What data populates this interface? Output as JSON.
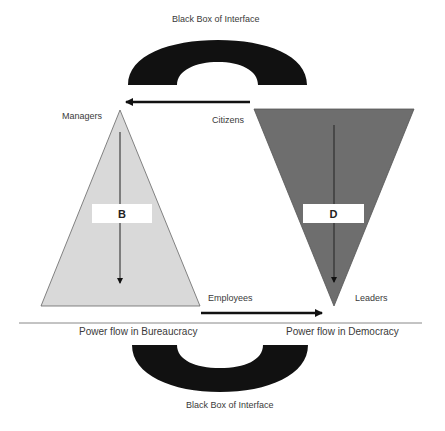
{
  "diagram": {
    "top_arch_caption": "Black Box of Interface",
    "bottom_arch_caption": "Black Box of Interface",
    "bureaucracy": {
      "letter": "B",
      "top_label": "Managers",
      "bottom_label": "Employees",
      "caption": "Power flow in Bureaucracy",
      "fill": "#d9d9d9"
    },
    "democracy": {
      "letter": "D",
      "top_label": "Citizens",
      "bottom_label": "Leaders",
      "caption": "Power flow in Democracy",
      "fill": "#6e6e6e"
    },
    "arch_color": "#111111",
    "arrow_color": "#111111"
  }
}
